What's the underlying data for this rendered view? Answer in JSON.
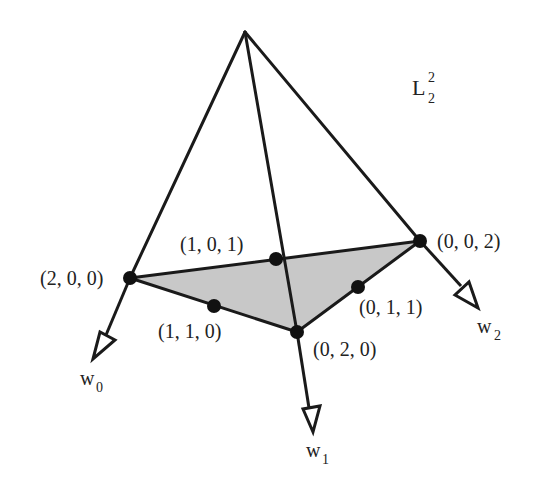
{
  "diagram": {
    "title": {
      "base": "L",
      "sub": "2",
      "sup": "2"
    },
    "colors": {
      "line": "#1a1a1a",
      "fill": "#c8c8c8",
      "dot": "#111111",
      "text": "#222222"
    },
    "apex": {
      "x": 245,
      "y": 32
    },
    "vertices": [
      {
        "id": "v200",
        "label": "(2, 0, 0)",
        "x": 130,
        "y": 278
      },
      {
        "id": "v020",
        "label": "(0, 2, 0)",
        "x": 297,
        "y": 332
      },
      {
        "id": "v002",
        "label": "(0, 0, 2)",
        "x": 420,
        "y": 241
      }
    ],
    "midpoints": [
      {
        "id": "m101",
        "label": "(1, 0, 1)",
        "x": 276,
        "y": 259
      },
      {
        "id": "m110",
        "label": "(1, 1, 0)",
        "x": 214,
        "y": 306
      },
      {
        "id": "m011",
        "label": "(0, 1, 1)",
        "x": 358,
        "y": 287
      }
    ],
    "weights": [
      {
        "id": "w0",
        "base": "w",
        "sub": "0"
      },
      {
        "id": "w1",
        "base": "w",
        "sub": "1"
      },
      {
        "id": "w2",
        "base": "w",
        "sub": "2"
      }
    ]
  }
}
